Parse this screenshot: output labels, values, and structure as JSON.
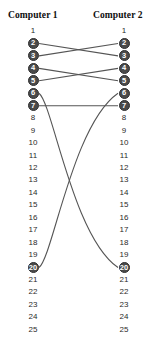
{
  "headers": {
    "left": "Computer 1",
    "right": "Computer 2"
  },
  "colors": {
    "pin_active_fill": "#4a4a4a",
    "pin_active_text": "#ffffff",
    "pin_text": "#2b2b2b",
    "wire": "#555555",
    "background": "#ffffff",
    "header_text": "#0d0d0d"
  },
  "geometry": {
    "left_column_x": 33,
    "right_column_x": 124,
    "first_pin_y": 31,
    "pin_spacing": 12.45
  },
  "pins": {
    "count": 25,
    "numbers": [
      1,
      2,
      3,
      4,
      5,
      6,
      7,
      8,
      9,
      10,
      11,
      12,
      13,
      14,
      15,
      16,
      17,
      18,
      19,
      20,
      21,
      22,
      23,
      24,
      25
    ],
    "active": [
      2,
      3,
      4,
      5,
      6,
      7,
      20
    ]
  },
  "left_pins": [
    {
      "n": "1",
      "active": false
    },
    {
      "n": "2",
      "active": true
    },
    {
      "n": "3",
      "active": true
    },
    {
      "n": "4",
      "active": true
    },
    {
      "n": "5",
      "active": true
    },
    {
      "n": "6",
      "active": true
    },
    {
      "n": "7",
      "active": true
    },
    {
      "n": "8",
      "active": false
    },
    {
      "n": "9",
      "active": false
    },
    {
      "n": "10",
      "active": false
    },
    {
      "n": "11",
      "active": false
    },
    {
      "n": "12",
      "active": false
    },
    {
      "n": "13",
      "active": false
    },
    {
      "n": "14",
      "active": false
    },
    {
      "n": "15",
      "active": false
    },
    {
      "n": "16",
      "active": false
    },
    {
      "n": "17",
      "active": false
    },
    {
      "n": "18",
      "active": false
    },
    {
      "n": "19",
      "active": false
    },
    {
      "n": "20",
      "active": true
    },
    {
      "n": "21",
      "active": false
    },
    {
      "n": "22",
      "active": false
    },
    {
      "n": "23",
      "active": false
    },
    {
      "n": "24",
      "active": false
    },
    {
      "n": "25",
      "active": false
    }
  ],
  "right_pins": [
    {
      "n": "1",
      "active": false
    },
    {
      "n": "2",
      "active": true
    },
    {
      "n": "3",
      "active": true
    },
    {
      "n": "4",
      "active": true
    },
    {
      "n": "5",
      "active": true
    },
    {
      "n": "6",
      "active": true
    },
    {
      "n": "7",
      "active": true
    },
    {
      "n": "8",
      "active": false
    },
    {
      "n": "9",
      "active": false
    },
    {
      "n": "10",
      "active": false
    },
    {
      "n": "11",
      "active": false
    },
    {
      "n": "12",
      "active": false
    },
    {
      "n": "13",
      "active": false
    },
    {
      "n": "14",
      "active": false
    },
    {
      "n": "15",
      "active": false
    },
    {
      "n": "16",
      "active": false
    },
    {
      "n": "17",
      "active": false
    },
    {
      "n": "18",
      "active": false
    },
    {
      "n": "19",
      "active": false
    },
    {
      "n": "20",
      "active": true
    },
    {
      "n": "21",
      "active": false
    },
    {
      "n": "22",
      "active": false
    },
    {
      "n": "23",
      "active": false
    },
    {
      "n": "24",
      "active": false
    },
    {
      "n": "25",
      "active": false
    }
  ],
  "connections": [
    {
      "from": 2,
      "to": 3,
      "style": "straight"
    },
    {
      "from": 3,
      "to": 2,
      "style": "straight"
    },
    {
      "from": 4,
      "to": 5,
      "style": "straight"
    },
    {
      "from": 5,
      "to": 4,
      "style": "straight"
    },
    {
      "from": 6,
      "to": 20,
      "style": "curve"
    },
    {
      "from": 7,
      "to": 7,
      "style": "straight"
    },
    {
      "from": 20,
      "to": 6,
      "style": "curve"
    }
  ]
}
